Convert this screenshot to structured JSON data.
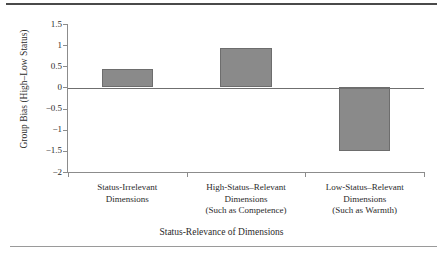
{
  "chart_data": {
    "type": "bar",
    "title": "",
    "xlabel": "Status-Relevance of Dimensions",
    "ylabel": "Group Bias (High–Low Status)",
    "categories": [
      "Status-Irrelevant Dimensions",
      "High-Status–Relevant Dimensions (Such as Competence)",
      "Low-Status–Relevant Dimensions (Such as Warmth)"
    ],
    "category_lines": [
      [
        "Status-Irrelevant",
        "Dimensions"
      ],
      [
        "High-Status–Relevant",
        "Dimensions",
        "(Such as Competence)"
      ],
      [
        "Low-Status–Relevant",
        "Dimensions",
        "(Such as Warmth)"
      ]
    ],
    "values": [
      0.43,
      0.93,
      -1.5
    ],
    "ylim": [
      -2,
      1.5
    ],
    "ytick_labels": [
      "1.5",
      "1",
      "0.5",
      "0",
      "−0.5",
      "−1",
      "−1.5",
      "−2"
    ],
    "ytick_values": [
      1.5,
      1,
      0.5,
      0,
      -0.5,
      -1,
      -1.5,
      -2
    ],
    "grid": false,
    "legend": false,
    "zero_line": true,
    "bar_color": "#8a8a8a",
    "bar_edge_color": "#6d6d6d",
    "axis_color": "#8c8c8c",
    "text_color": "#2b2b2b",
    "rule_top_color": "#4a4a4a",
    "rule_bottom_color": "#9a9a9a"
  }
}
